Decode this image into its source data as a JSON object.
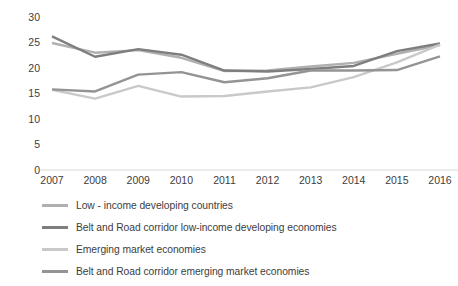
{
  "chart_data": {
    "type": "line",
    "title": "",
    "xlabel": "",
    "ylabel": "Public and publicly guaranteed external debt (% of GDP)",
    "categories": [
      "2007",
      "2008",
      "2009",
      "2010",
      "2011",
      "2012",
      "2013",
      "2014",
      "2015",
      "2016"
    ],
    "x": [
      2007,
      2008,
      2009,
      2010,
      2011,
      2012,
      2013,
      2014,
      2015,
      2016
    ],
    "ylim": [
      0,
      30
    ],
    "yticks": [
      0,
      5,
      10,
      15,
      20,
      25,
      30
    ],
    "grid": false,
    "legend_position": "bottom-left",
    "series": [
      {
        "name": "Low - income developing countries",
        "color": "#b0b0b0",
        "values": [
          24.9,
          23.0,
          23.5,
          22.0,
          19.4,
          19.5,
          20.3,
          21.0,
          22.8,
          24.5
        ]
      },
      {
        "name": "Belt and Road corridor low-income developing economies",
        "color": "#7e7e7e",
        "values": [
          26.2,
          22.2,
          23.7,
          22.6,
          19.5,
          19.3,
          19.8,
          20.4,
          23.3,
          24.8
        ]
      },
      {
        "name": "Emerging market economies",
        "color": "#c9c9c9",
        "values": [
          15.7,
          14.0,
          16.5,
          14.4,
          14.5,
          15.4,
          16.2,
          18.2,
          21.1,
          24.6
        ]
      },
      {
        "name": "Belt and Road corridor emerging market economies",
        "color": "#949494",
        "values": [
          15.8,
          15.4,
          18.7,
          19.2,
          17.2,
          18.0,
          19.5,
          19.5,
          19.6,
          22.3
        ]
      }
    ]
  },
  "axis": {
    "y_title": "Public and publicly guaranteed external debt (% of GDP)",
    "y_ticks": [
      "30",
      "25",
      "20",
      "15",
      "10",
      "5",
      "0"
    ],
    "x_ticks": [
      "2007",
      "2008",
      "2009",
      "2010",
      "2011",
      "2012",
      "2013",
      "2014",
      "2015",
      "2016"
    ]
  },
  "legend": {
    "items": [
      {
        "label": "Low - income developing countries",
        "color": "#b0b0b0"
      },
      {
        "label": "Belt and Road corridor low-income developing economies",
        "color": "#7e7e7e"
      },
      {
        "label": "Emerging market economies",
        "color": "#c9c9c9"
      },
      {
        "label": "Belt and Road corridor emerging market economies",
        "color": "#949494"
      }
    ]
  },
  "colors": {
    "baseline": "#d9d9d9",
    "text": "#3d3d3d",
    "background": "#ffffff"
  }
}
